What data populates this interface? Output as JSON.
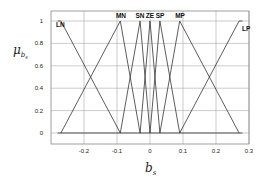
{
  "chart_data": {
    "type": "line",
    "title": "",
    "xlabel": "b_s",
    "ylabel": "μ_{b_s}",
    "xlim": [
      -0.3,
      0.3
    ],
    "ylim": [
      -0.1,
      1.1
    ],
    "grid": true,
    "xticks": [
      "-0.2",
      "-0.1",
      "0",
      "0.1",
      "0.2",
      "0.3"
    ],
    "yticks": [
      "0",
      "0.2",
      "0.4",
      "0.6",
      "0.8",
      "1"
    ],
    "series": [
      {
        "name": "LN",
        "points": [
          [
            -0.28,
            1
          ],
          [
            -0.27,
            1
          ],
          [
            -0.09,
            0
          ]
        ]
      },
      {
        "name": "MN",
        "points": [
          [
            -0.27,
            0
          ],
          [
            -0.09,
            1
          ],
          [
            -0.03,
            0
          ]
        ]
      },
      {
        "name": "SN",
        "points": [
          [
            -0.09,
            0
          ],
          [
            -0.03,
            1
          ],
          [
            0,
            0
          ]
        ]
      },
      {
        "name": "ZE",
        "points": [
          [
            -0.03,
            0
          ],
          [
            0,
            1
          ],
          [
            0.03,
            0
          ]
        ]
      },
      {
        "name": "SP",
        "points": [
          [
            0,
            0
          ],
          [
            0.03,
            1
          ],
          [
            0.09,
            0
          ]
        ]
      },
      {
        "name": "MP",
        "points": [
          [
            0.03,
            0
          ],
          [
            0.09,
            1
          ],
          [
            0.27,
            0
          ]
        ]
      },
      {
        "name": "LP",
        "points": [
          [
            0.09,
            0
          ],
          [
            0.27,
            1
          ],
          [
            0.28,
            1
          ]
        ]
      }
    ],
    "baseline": [
      [
        -0.28,
        0
      ],
      [
        0.28,
        0
      ]
    ]
  },
  "labels": {
    "x_axis": "b",
    "x_axis_sub": "s",
    "y_axis": "μ",
    "y_axis_sub": "b",
    "y_axis_subsub": "s"
  }
}
